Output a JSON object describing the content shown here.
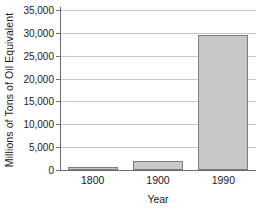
{
  "chart_data": {
    "type": "bar",
    "title": "",
    "subtitle": "",
    "xlabel": "Year",
    "ylabel": "Millions of Tons of Oil Equivalent",
    "categories": [
      "1800",
      "1900",
      "1990"
    ],
    "values": [
      500,
      2000,
      29500
    ],
    "series": [
      {
        "name": "World energy consumption",
        "values": [
          500,
          2000,
          29500
        ]
      }
    ],
    "ylim": [
      0,
      35000
    ],
    "yticks": [
      0,
      5000,
      10000,
      15000,
      20000,
      25000,
      30000,
      35000
    ],
    "ytick_labels": [
      "0",
      "5,000",
      "10,000",
      "15,000",
      "20,000",
      "25,000",
      "30,000",
      "35,000"
    ],
    "xtick_labels": [
      "1800",
      "1900",
      "1990"
    ],
    "grid": "horizontal",
    "legend": "none",
    "annotations": [],
    "colors": {
      "bar_fill": "#c8c8c8",
      "bar_edge": "#7d7d7d",
      "gridline": "#c9c9c9",
      "axis": "#6e6e6e",
      "background": "#ffffff",
      "text": "#1a1a1a"
    }
  }
}
